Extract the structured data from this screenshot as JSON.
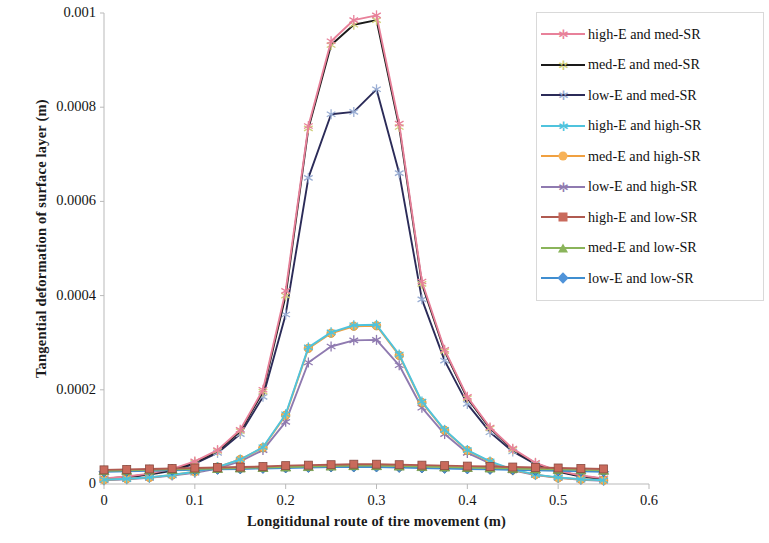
{
  "chart_data": {
    "type": "line",
    "title": "",
    "xlabel": "Longitidunal route of tire movement (m)",
    "ylabel": "Tangential deformation of surface layer (m)",
    "xlim": [
      0,
      0.6
    ],
    "ylim": [
      0,
      0.001
    ],
    "xticks": [
      "0",
      "0.1",
      "0.2",
      "0.3",
      "0.4",
      "0.5",
      "0.6"
    ],
    "xtick_values": [
      0,
      0.1,
      0.2,
      0.3,
      0.4,
      0.5,
      0.6
    ],
    "yticks": [
      "0",
      "0.0002",
      "0.0004",
      "0.0006",
      "0.0008",
      "0.001"
    ],
    "ytick_values": [
      0,
      0.0002,
      0.0004,
      0.0006,
      0.0008,
      0.001
    ],
    "grid": false,
    "legend_position": "right",
    "x": [
      0,
      0.025,
      0.05,
      0.075,
      0.1,
      0.125,
      0.15,
      0.175,
      0.2,
      0.225,
      0.25,
      0.275,
      0.3,
      0.325,
      0.35,
      0.375,
      0.4,
      0.425,
      0.45,
      0.475,
      0.5,
      0.525,
      0.55
    ],
    "series": [
      {
        "name": "high-E and med-SR",
        "color": "#e8819a",
        "marker": "star",
        "marker_color": "#e8819a",
        "values": [
          1.2e-05,
          1.6e-05,
          2.2e-05,
          3.2e-05,
          4.8e-05,
          7.2e-05,
          0.000115,
          0.0002,
          0.00041,
          0.00076,
          0.00094,
          0.000985,
          0.000995,
          0.000765,
          0.00043,
          0.000285,
          0.000185,
          0.00012,
          7.5e-05,
          4.5e-05,
          2.8e-05,
          1.8e-05,
          1.2e-05
        ]
      },
      {
        "name": "med-E and med-SR",
        "color": "#1a1a1a",
        "marker": "star",
        "marker_color": "#cfcf7a",
        "values": [
          1.1e-05,
          1.5e-05,
          2.1e-05,
          3e-05,
          4.6e-05,
          7e-05,
          0.000112,
          0.000196,
          0.0004,
          0.000755,
          0.000932,
          0.000975,
          0.000985,
          0.000758,
          0.000425,
          0.000282,
          0.000182,
          0.000118,
          7.3e-05,
          4.4e-05,
          2.7e-05,
          1.7e-05,
          1.1e-05
        ]
      },
      {
        "name": "low-E and med-SR",
        "color": "#2b2b58",
        "marker": "star",
        "marker_color": "#9aaed4",
        "values": [
          1e-05,
          1.4e-05,
          2e-05,
          2.8e-05,
          4.3e-05,
          6.6e-05,
          0.000106,
          0.000185,
          0.00036,
          0.00065,
          0.000785,
          0.00079,
          0.000838,
          0.00066,
          0.000392,
          0.000262,
          0.00017,
          0.00011,
          6.9e-05,
          4.2e-05,
          2.6e-05,
          1.6e-05,
          1e-05
        ]
      },
      {
        "name": "high-E and high-SR",
        "color": "#4fc3dd",
        "marker": "star",
        "marker_color": "#4fc3dd",
        "values": [
          9e-06,
          1.1e-05,
          1.4e-05,
          1.9e-05,
          2.6e-05,
          3.6e-05,
          5.2e-05,
          7.8e-05,
          0.000148,
          0.00029,
          0.000322,
          0.000337,
          0.000338,
          0.000275,
          0.000175,
          0.000115,
          7.2e-05,
          4.8e-05,
          3.1e-05,
          2e-05,
          1.4e-05,
          1e-05,
          8e-06
        ]
      },
      {
        "name": "med-E and high-SR",
        "color": "#f0a040",
        "marker": "circle",
        "marker_color": "#f7b258",
        "values": [
          9e-06,
          1.1e-05,
          1.4e-05,
          1.9e-05,
          2.6e-05,
          3.6e-05,
          5.2e-05,
          7.7e-05,
          0.000146,
          0.000288,
          0.00032,
          0.000335,
          0.000336,
          0.000273,
          0.000173,
          0.000114,
          7.1e-05,
          4.7e-05,
          3e-05,
          2e-05,
          1.3e-05,
          1e-05,
          8e-06
        ]
      },
      {
        "name": "low-E and high-SR",
        "color": "#8f7ab0",
        "marker": "star",
        "marker_color": "#8f7ab0",
        "values": [
          8e-06,
          1e-05,
          1.3e-05,
          1.8e-05,
          2.4e-05,
          3.3e-05,
          4.8e-05,
          7.2e-05,
          0.000132,
          0.000258,
          0.000292,
          0.000305,
          0.000306,
          0.000252,
          0.000162,
          0.000106,
          6.6e-05,
          4.4e-05,
          2.9e-05,
          1.9e-05,
          1.3e-05,
          9e-06,
          7e-06
        ]
      },
      {
        "name": "high-E and low-SR",
        "color": "#b05a50",
        "marker": "square",
        "marker_color": "#c96a5c",
        "values": [
          3e-05,
          3.1e-05,
          3.2e-05,
          3.3e-05,
          3.4e-05,
          3.5e-05,
          3.6e-05,
          3.7e-05,
          3.9e-05,
          4e-05,
          4.1e-05,
          4.2e-05,
          4.2e-05,
          4.1e-05,
          4e-05,
          3.9e-05,
          3.8e-05,
          3.7e-05,
          3.6e-05,
          3.5e-05,
          3.4e-05,
          3.3e-05,
          3.2e-05
        ]
      },
      {
        "name": "med-E and low-SR",
        "color": "#8ab45a",
        "marker": "triangle",
        "marker_color": "#8ab45a",
        "values": [
          2.8e-05,
          2.9e-05,
          3e-05,
          3.1e-05,
          3.2e-05,
          3.3e-05,
          3.4e-05,
          3.5e-05,
          3.6e-05,
          3.7e-05,
          3.8e-05,
          3.9e-05,
          3.9e-05,
          3.8e-05,
          3.7e-05,
          3.6e-05,
          3.5e-05,
          3.4e-05,
          3.3e-05,
          3.2e-05,
          3.1e-05,
          3e-05,
          2.9e-05
        ]
      },
      {
        "name": "low-E and low-SR",
        "color": "#3f8ed0",
        "marker": "diamond",
        "marker_color": "#4f93d9",
        "values": [
          2.6e-05,
          2.7e-05,
          2.8e-05,
          2.9e-05,
          3e-05,
          3.1e-05,
          3.2e-05,
          3.3e-05,
          3.4e-05,
          3.5e-05,
          3.6e-05,
          3.6e-05,
          3.6e-05,
          3.5e-05,
          3.4e-05,
          3.3e-05,
          3.2e-05,
          3.1e-05,
          3e-05,
          2.9e-05,
          2.8e-05,
          2.7e-05,
          2.6e-05
        ]
      }
    ]
  }
}
